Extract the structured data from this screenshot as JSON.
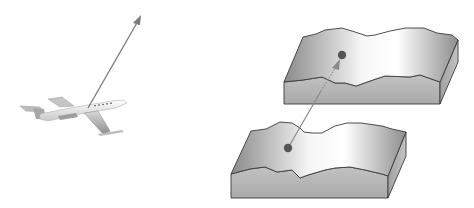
{
  "diagram": {
    "background": "#ffffff",
    "panels": [
      {
        "name": "aircraft-panel",
        "elements": {
          "airplane": {
            "kind": "jet-aircraft",
            "heading": "right, banked",
            "center": [
              70,
              118
            ]
          },
          "velocity_arrow": {
            "from": [
              88,
              108
            ],
            "to": [
              141,
              16
            ],
            "color": "#7a7a7a",
            "style": "solid"
          }
        }
      },
      {
        "name": "terrain-panel",
        "elements": {
          "upper_block": {
            "kind": "terrain-slab",
            "top_left": [
              285,
              40
            ]
          },
          "lower_block": {
            "kind": "terrain-slab",
            "top_left": [
              232,
              120
            ]
          },
          "start_point": {
            "center": [
              288,
              148
            ],
            "color": "#555555"
          },
          "end_point": {
            "center": [
              342,
              55
            ],
            "color": "#555555"
          },
          "displacement_arrow": {
            "from": [
              288,
              148
            ],
            "to": [
              337,
              65
            ],
            "color": "#8a8a8a",
            "style": "dotted-upper-segment"
          }
        }
      }
    ],
    "colors": {
      "slab_side": "#b8b8b8",
      "slab_top_dark": "#8e8e8e",
      "slab_top_light": "#f4f4f4",
      "outline": "#3a3a3a",
      "arrow": "#808080",
      "point": "#555555"
    }
  }
}
